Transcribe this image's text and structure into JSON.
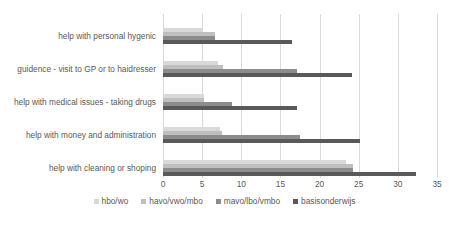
{
  "chart_data": {
    "type": "bar",
    "orientation": "horizontal",
    "title": "",
    "subtitle": "",
    "xlabel": "",
    "ylabel": "",
    "xlim": [
      0,
      35
    ],
    "xticks": [
      "0",
      "5",
      "10",
      "15",
      "20",
      "25",
      "30",
      "35"
    ],
    "grid": true,
    "legend_position": "bottom",
    "categories": [
      "help with personal hygenic",
      "guidence - visit to GP or to haidresser",
      "help with medical issues - taking drugs",
      "help with money and administration",
      "help with cleaning or shoping"
    ],
    "series": [
      {
        "name": "hbo/wo",
        "color": "#d9d9d9",
        "values": [
          5.0,
          7.0,
          5.3,
          7.3,
          23.4
        ]
      },
      {
        "name": "havo/vwo/mbo",
        "color": "#bfbfbf",
        "values": [
          6.7,
          7.7,
          5.3,
          7.6,
          24.3
        ]
      },
      {
        "name": "mavo/lbo/vmbo",
        "color": "#8c8c8c",
        "values": [
          6.7,
          17.1,
          8.8,
          17.5,
          24.3
        ]
      },
      {
        "name": "basisonderwijs",
        "color": "#595959",
        "values": [
          16.5,
          24.2,
          17.1,
          25.2,
          32.3
        ]
      }
    ]
  },
  "legend": {
    "items": [
      {
        "label": "hbo/wo",
        "color": "#d9d9d9"
      },
      {
        "label": "havo/vwo/mbo",
        "color": "#bfbfbf"
      },
      {
        "label": "mavo/lbo/vmbo",
        "color": "#8c8c8c"
      },
      {
        "label": "basisonderwijs",
        "color": "#595959"
      }
    ]
  },
  "axis": {
    "gridline_color": "#d9d9d9",
    "axis_color": "#bfbfbf"
  }
}
